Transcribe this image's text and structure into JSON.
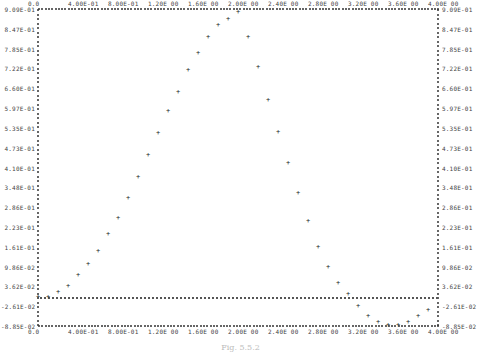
{
  "chart_data": {
    "type": "scatter",
    "title": "",
    "caption": "Fig. 5.5.2",
    "xlabel": "",
    "ylabel": "",
    "xlim": [
      0.0,
      4.0
    ],
    "ylim": [
      -0.0985,
      0.909
    ],
    "x_ticks": [
      "0.0",
      "4.00E-01",
      "8.00E-01",
      "1.20E 00",
      "1.60E 00",
      "2.00E 00",
      "2.40E 00",
      "2.80E 00",
      "3.20E 00",
      "3.60E 00",
      "4.00E 00"
    ],
    "y_ticks": [
      "9.09E-01",
      "8.47E-01",
      "7.85E-01",
      "7.22E-01",
      "6.60E-01",
      "5.97E-01",
      "5.35E-01",
      "4.73E-01",
      "4.10E-01",
      "3.48E-01",
      "2.86E-01",
      "2.23E-01",
      "1.61E-01",
      "9.86E-02",
      "3.62E-02",
      "-2.61E-02",
      "-8.85E-02"
    ],
    "grid": false,
    "legend": null,
    "series": [
      {
        "name": "response",
        "marker": "+",
        "x": [
          0.0,
          0.1,
          0.2,
          0.3,
          0.4,
          0.5,
          0.6,
          0.7,
          0.8,
          0.9,
          1.0,
          1.1,
          1.2,
          1.3,
          1.4,
          1.5,
          1.6,
          1.7,
          1.8,
          1.9,
          2.0,
          2.1,
          2.2,
          2.3,
          2.4,
          2.5,
          2.6,
          2.7,
          2.8,
          2.9,
          3.0,
          3.1,
          3.2,
          3.3,
          3.4,
          3.5,
          3.6,
          3.7,
          3.8,
          3.9
        ],
        "y": [
          0.0,
          0.0,
          0.015,
          0.035,
          0.07,
          0.105,
          0.145,
          0.2,
          0.25,
          0.315,
          0.38,
          0.45,
          0.52,
          0.59,
          0.65,
          0.72,
          0.775,
          0.825,
          0.865,
          0.885,
          0.905,
          0.825,
          0.73,
          0.625,
          0.525,
          0.425,
          0.33,
          0.24,
          0.16,
          0.095,
          0.045,
          0.01,
          -0.03,
          -0.06,
          -0.08,
          -0.09,
          -0.09,
          -0.08,
          -0.06,
          -0.04
        ]
      }
    ],
    "zero_line": 0.0
  }
}
